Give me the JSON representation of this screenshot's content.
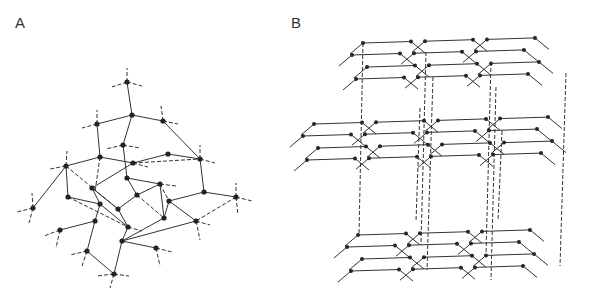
{
  "panels": {
    "a": {
      "label": "A",
      "nodes": [
        [
          127,
          82
        ],
        [
          132,
          115
        ],
        [
          97,
          124
        ],
        [
          163,
          121
        ],
        [
          123,
          145
        ],
        [
          100,
          157
        ],
        [
          133,
          163
        ],
        [
          168,
          154
        ],
        [
          200,
          159
        ],
        [
          66,
          166
        ],
        [
          127,
          178
        ],
        [
          92,
          188
        ],
        [
          160,
          184
        ],
        [
          68,
          197
        ],
        [
          137,
          195
        ],
        [
          204,
          192
        ],
        [
          33,
          208
        ],
        [
          100,
          204
        ],
        [
          118,
          209
        ],
        [
          169,
          201
        ],
        [
          236,
          197
        ],
        [
          95,
          221
        ],
        [
          128,
          227
        ],
        [
          164,
          218
        ],
        [
          196,
          221
        ],
        [
          60,
          230
        ],
        [
          122,
          241
        ],
        [
          87,
          251
        ],
        [
          156,
          248
        ],
        [
          114,
          274
        ]
      ],
      "solid_edges": [
        [
          0,
          1
        ],
        [
          1,
          2
        ],
        [
          1,
          3
        ],
        [
          1,
          4
        ],
        [
          2,
          5
        ],
        [
          3,
          8
        ],
        [
          5,
          9
        ],
        [
          5,
          6
        ],
        [
          6,
          7
        ],
        [
          7,
          8
        ],
        [
          4,
          10
        ],
        [
          6,
          11
        ],
        [
          10,
          12
        ],
        [
          8,
          15
        ],
        [
          15,
          20
        ],
        [
          9,
          13
        ],
        [
          9,
          16
        ],
        [
          11,
          18
        ],
        [
          12,
          23
        ],
        [
          13,
          17
        ],
        [
          15,
          19
        ],
        [
          17,
          21
        ],
        [
          17,
          22
        ],
        [
          18,
          22
        ],
        [
          19,
          23
        ],
        [
          19,
          24
        ],
        [
          21,
          25
        ],
        [
          21,
          27
        ],
        [
          22,
          26
        ],
        [
          23,
          26
        ],
        [
          24,
          26
        ],
        [
          26,
          28
        ],
        [
          26,
          29
        ],
        [
          27,
          29
        ],
        [
          11,
          17
        ],
        [
          10,
          14
        ],
        [
          14,
          18
        ],
        [
          12,
          14
        ]
      ],
      "dashed_edges": [
        [
          6,
          8
        ],
        [
          9,
          18
        ],
        [
          14,
          23
        ],
        [
          12,
          19
        ],
        [
          20,
          24
        ],
        [
          13,
          22
        ]
      ],
      "stubs": [
        [
          127,
          82,
          127,
          68
        ],
        [
          127,
          82,
          112,
          87
        ],
        [
          127,
          82,
          142,
          86
        ],
        [
          97,
          124,
          97,
          110
        ],
        [
          97,
          124,
          82,
          128
        ],
        [
          163,
          121,
          161,
          106
        ],
        [
          163,
          121,
          178,
          124
        ],
        [
          66,
          166,
          67,
          151
        ],
        [
          66,
          166,
          50,
          169
        ],
        [
          200,
          159,
          200,
          145
        ],
        [
          200,
          159,
          215,
          163
        ],
        [
          123,
          145,
          106,
          149
        ],
        [
          123,
          145,
          140,
          148
        ],
        [
          133,
          163,
          148,
          167
        ],
        [
          100,
          157,
          95,
          192
        ],
        [
          33,
          208,
          17,
          212
        ],
        [
          33,
          208,
          32,
          193
        ],
        [
          33,
          208,
          29,
          223
        ],
        [
          236,
          197,
          236,
          183
        ],
        [
          236,
          197,
          252,
          201
        ],
        [
          236,
          197,
          238,
          215
        ],
        [
          60,
          230,
          44,
          236
        ],
        [
          60,
          230,
          56,
          248
        ],
        [
          196,
          221,
          210,
          225
        ],
        [
          196,
          221,
          200,
          240
        ],
        [
          87,
          251,
          70,
          255
        ],
        [
          87,
          251,
          82,
          266
        ],
        [
          156,
          248,
          172,
          252
        ],
        [
          156,
          248,
          160,
          266
        ],
        [
          114,
          274,
          97,
          276
        ],
        [
          114,
          274,
          129,
          276
        ],
        [
          114,
          274,
          110,
          288
        ],
        [
          160,
          184,
          176,
          186
        ],
        [
          128,
          227,
          142,
          231
        ]
      ]
    },
    "b": {
      "label": "B",
      "layers": [
        {
          "name": "top-layer",
          "nodes": [
            [
              421,
              29
            ],
            [
              469,
              28
            ],
            [
              363,
              43
            ],
            [
              411,
              41
            ],
            [
              483,
              39
            ],
            [
              532,
              37
            ],
            [
              350,
              54
            ],
            [
              426,
              52
            ],
            [
              473,
              51
            ],
            [
              549,
              51
            ],
            [
              368,
              66
            ],
            [
              414,
              65
            ],
            [
              491,
              62
            ],
            [
              541,
              61
            ],
            [
              433,
              77
            ],
            [
              479,
              75
            ],
            [
              554,
              73
            ],
            [
              496,
              87
            ],
            [
              541,
              85
            ]
          ]
        },
        {
          "name": "middle-layer",
          "nodes": [
            [
              373,
              110
            ],
            [
              420,
              108
            ],
            [
              314,
              124
            ],
            [
              362,
              123
            ],
            [
              437,
              121
            ],
            [
              485,
              118
            ],
            [
              304,
              136
            ],
            [
              379,
              135
            ],
            [
              426,
              134
            ],
            [
              502,
              131
            ],
            [
              550,
              128
            ],
            [
              319,
              149
            ],
            [
              367,
              147
            ],
            [
              443,
              145
            ],
            [
              490,
              143
            ],
            [
              566,
              141
            ],
            [
              385,
              160
            ],
            [
              431,
              158
            ],
            [
              507,
              155
            ],
            [
              553,
              153
            ],
            [
              449,
              170
            ],
            [
              495,
              168
            ],
            [
              570,
              166
            ],
            [
              511,
              180
            ],
            [
              556,
              178
            ]
          ]
        },
        {
          "name": "bottom-layer",
          "nodes": [
            [
              416,
              221
            ],
            [
              463,
              219
            ],
            [
              358,
              235
            ],
            [
              406,
              234
            ],
            [
              479,
              232
            ],
            [
              526,
              230
            ],
            [
              346,
              247
            ],
            [
              421,
              245
            ],
            [
              468,
              244
            ],
            [
              544,
              242
            ],
            [
              361,
              259
            ],
            [
              410,
              257
            ],
            [
              486,
              255
            ],
            [
              532,
              253
            ],
            [
              427,
              270
            ],
            [
              473,
              269
            ],
            [
              548,
              266
            ],
            [
              491,
              280
            ],
            [
              535,
              278
            ]
          ]
        }
      ]
    }
  }
}
